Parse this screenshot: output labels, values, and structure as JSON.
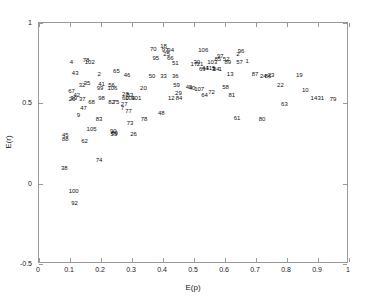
{
  "chart_data": {
    "type": "scatter",
    "title": "",
    "xlabel": "E(p)",
    "ylabel": "E(r)",
    "xlim": [
      0,
      1
    ],
    "ylim": [
      -0.5,
      1
    ],
    "xticks": [
      "0",
      "0.1",
      "0.2",
      "0.3",
      "0.4",
      "0.5",
      "0.6",
      "0.7",
      "0.8",
      "0.9",
      "1"
    ],
    "xtickvals": [
      0,
      0.1,
      0.2,
      0.3,
      0.4,
      0.5,
      0.6,
      0.7,
      0.8,
      0.9,
      1
    ],
    "yticks": [
      "-0.5",
      "0",
      "0.5",
      "1"
    ],
    "ytickvals": [
      -0.5,
      0,
      0.5,
      1
    ],
    "grid": false,
    "legend": null,
    "marker_style": "text-label",
    "note": "Each data point is rendered as its numeric index label rather than a marker symbol.",
    "points": [
      {
        "label": "18",
        "x": 0.405,
        "y": 0.852
      },
      {
        "label": "70",
        "x": 0.372,
        "y": 0.83
      },
      {
        "label": "93",
        "x": 0.41,
        "y": 0.828
      },
      {
        "label": "94",
        "x": 0.428,
        "y": 0.828
      },
      {
        "label": "106",
        "x": 0.533,
        "y": 0.828
      },
      {
        "label": "25",
        "x": 0.415,
        "y": 0.8
      },
      {
        "label": "96",
        "x": 0.655,
        "y": 0.822
      },
      {
        "label": "2",
        "x": 0.645,
        "y": 0.8
      },
      {
        "label": "95",
        "x": 0.38,
        "y": 0.778
      },
      {
        "label": "66",
        "x": 0.427,
        "y": 0.778
      },
      {
        "label": "97",
        "x": 0.588,
        "y": 0.79
      },
      {
        "label": "85",
        "x": 0.58,
        "y": 0.772
      },
      {
        "label": "52",
        "x": 0.607,
        "y": 0.77
      },
      {
        "label": "78",
        "x": 0.155,
        "y": 0.762
      },
      {
        "label": "102",
        "x": 0.167,
        "y": 0.752
      },
      {
        "label": "4",
        "x": 0.108,
        "y": 0.75
      },
      {
        "label": "51",
        "x": 0.443,
        "y": 0.742
      },
      {
        "label": "89",
        "x": 0.612,
        "y": 0.752
      },
      {
        "label": "103",
        "x": 0.562,
        "y": 0.748
      },
      {
        "label": "30",
        "x": 0.512,
        "y": 0.748
      },
      {
        "label": "57",
        "x": 0.65,
        "y": 0.748
      },
      {
        "label": "1",
        "x": 0.675,
        "y": 0.755
      },
      {
        "label": "17",
        "x": 0.503,
        "y": 0.737
      },
      {
        "label": "21",
        "x": 0.523,
        "y": 0.737
      },
      {
        "label": "43",
        "x": 0.12,
        "y": 0.682
      },
      {
        "label": "65",
        "x": 0.253,
        "y": 0.695
      },
      {
        "label": "2",
        "x": 0.197,
        "y": 0.675
      },
      {
        "label": "46",
        "x": 0.287,
        "y": 0.672
      },
      {
        "label": "50",
        "x": 0.368,
        "y": 0.665
      },
      {
        "label": "33",
        "x": 0.405,
        "y": 0.665
      },
      {
        "label": "36",
        "x": 0.443,
        "y": 0.665
      },
      {
        "label": "69",
        "x": 0.53,
        "y": 0.71
      },
      {
        "label": "44",
        "x": 0.54,
        "y": 0.712
      },
      {
        "label": "115",
        "x": 0.557,
        "y": 0.715
      },
      {
        "label": "3",
        "x": 0.566,
        "y": 0.707
      },
      {
        "label": "54",
        "x": 0.575,
        "y": 0.705
      },
      {
        "label": "1",
        "x": 0.588,
        "y": 0.705
      },
      {
        "label": "13",
        "x": 0.62,
        "y": 0.675
      },
      {
        "label": "87",
        "x": 0.7,
        "y": 0.678
      },
      {
        "label": "24",
        "x": 0.727,
        "y": 0.662
      },
      {
        "label": "86",
        "x": 0.742,
        "y": 0.662
      },
      {
        "label": "23",
        "x": 0.752,
        "y": 0.668
      },
      {
        "label": "19",
        "x": 0.843,
        "y": 0.672
      },
      {
        "label": "35",
        "x": 0.158,
        "y": 0.62
      },
      {
        "label": "32",
        "x": 0.142,
        "y": 0.608
      },
      {
        "label": "41",
        "x": 0.205,
        "y": 0.615
      },
      {
        "label": "56",
        "x": 0.237,
        "y": 0.608
      },
      {
        "label": "99",
        "x": 0.2,
        "y": 0.592
      },
      {
        "label": "106",
        "x": 0.24,
        "y": 0.588
      },
      {
        "label": "20",
        "x": 0.34,
        "y": 0.592
      },
      {
        "label": "59",
        "x": 0.447,
        "y": 0.605
      },
      {
        "label": "67",
        "x": 0.108,
        "y": 0.572
      },
      {
        "label": "49",
        "x": 0.487,
        "y": 0.598
      },
      {
        "label": "40",
        "x": 0.497,
        "y": 0.588
      },
      {
        "label": "107",
        "x": 0.52,
        "y": 0.583
      },
      {
        "label": "72",
        "x": 0.56,
        "y": 0.562
      },
      {
        "label": "58",
        "x": 0.605,
        "y": 0.598
      },
      {
        "label": "22",
        "x": 0.782,
        "y": 0.607
      },
      {
        "label": "10",
        "x": 0.862,
        "y": 0.578
      },
      {
        "label": "29",
        "x": 0.453,
        "y": 0.56
      },
      {
        "label": "28",
        "x": 0.282,
        "y": 0.553
      },
      {
        "label": "53",
        "x": 0.297,
        "y": 0.548
      },
      {
        "label": "42",
        "x": 0.125,
        "y": 0.548
      },
      {
        "label": "64",
        "x": 0.537,
        "y": 0.545
      },
      {
        "label": "81",
        "x": 0.625,
        "y": 0.548
      },
      {
        "label": "14",
        "x": 0.89,
        "y": 0.53
      },
      {
        "label": "31",
        "x": 0.912,
        "y": 0.525
      },
      {
        "label": "79",
        "x": 0.952,
        "y": 0.523
      },
      {
        "label": "39",
        "x": 0.115,
        "y": 0.53
      },
      {
        "label": "26",
        "x": 0.11,
        "y": 0.522
      },
      {
        "label": "98",
        "x": 0.205,
        "y": 0.53
      },
      {
        "label": "37",
        "x": 0.143,
        "y": 0.523
      },
      {
        "label": "12",
        "x": 0.43,
        "y": 0.53
      },
      {
        "label": "84",
        "x": 0.455,
        "y": 0.53
      },
      {
        "label": "60",
        "x": 0.282,
        "y": 0.528
      },
      {
        "label": "104",
        "x": 0.297,
        "y": 0.528
      },
      {
        "label": "101",
        "x": 0.317,
        "y": 0.528
      },
      {
        "label": "68",
        "x": 0.173,
        "y": 0.505
      },
      {
        "label": "82",
        "x": 0.237,
        "y": 0.502
      },
      {
        "label": "75",
        "x": 0.252,
        "y": 0.502
      },
      {
        "label": "63",
        "x": 0.795,
        "y": 0.488
      },
      {
        "label": "27",
        "x": 0.278,
        "y": 0.49
      },
      {
        "label": "47",
        "x": 0.147,
        "y": 0.462
      },
      {
        "label": "7",
        "x": 0.272,
        "y": 0.462
      },
      {
        "label": "77",
        "x": 0.292,
        "y": 0.448
      },
      {
        "label": "48",
        "x": 0.398,
        "y": 0.433
      },
      {
        "label": "9",
        "x": 0.13,
        "y": 0.42
      },
      {
        "label": "61",
        "x": 0.642,
        "y": 0.405
      },
      {
        "label": "80",
        "x": 0.723,
        "y": 0.395
      },
      {
        "label": "83",
        "x": 0.197,
        "y": 0.395
      },
      {
        "label": "78",
        "x": 0.342,
        "y": 0.395
      },
      {
        "label": "73",
        "x": 0.297,
        "y": 0.372
      },
      {
        "label": "105",
        "x": 0.173,
        "y": 0.333
      },
      {
        "label": "90",
        "x": 0.243,
        "y": 0.32
      },
      {
        "label": "89",
        "x": 0.247,
        "y": 0.312
      },
      {
        "label": "55",
        "x": 0.245,
        "y": 0.305
      },
      {
        "label": "26",
        "x": 0.308,
        "y": 0.303
      },
      {
        "label": "45",
        "x": 0.088,
        "y": 0.297
      },
      {
        "label": "88",
        "x": 0.088,
        "y": 0.272
      },
      {
        "label": "62",
        "x": 0.15,
        "y": 0.258
      },
      {
        "label": "74",
        "x": 0.197,
        "y": 0.14
      },
      {
        "label": "38",
        "x": 0.085,
        "y": 0.09
      },
      {
        "label": "100",
        "x": 0.115,
        "y": -0.05
      },
      {
        "label": "92",
        "x": 0.118,
        "y": -0.125
      }
    ]
  },
  "axes": {
    "xlabel": "E(p)",
    "ylabel": "E(r)"
  }
}
